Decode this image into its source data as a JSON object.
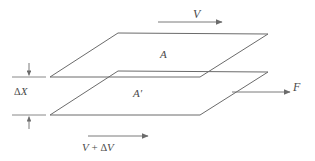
{
  "figure": {
    "canvas": {
      "width": 315,
      "height": 161
    },
    "line_color": "#6b6b6b",
    "text_color": "#4a4a4a",
    "background": "#ffffff"
  },
  "labels": {
    "velocity_top": "V",
    "area_top": "A",
    "area_bottom_base": "A",
    "area_bottom_prime": "′",
    "force": "F",
    "separation_delta": "Δ",
    "separation_var": "X",
    "velocity_bottom_base": "V",
    "velocity_bottom_plus": " + ",
    "velocity_bottom_delta": "Δ",
    "velocity_bottom_var": "V"
  },
  "geometry": {
    "top_plane": {
      "name": "top-plate",
      "points": "118,33 268,34 200,77 50,77"
    },
    "bottom_plane": {
      "name": "bottom-plate",
      "points": "118,71 268,72 200,115 50,115"
    },
    "arrow_top": {
      "x1": 158,
      "y1": 22,
      "x2": 222,
      "y2": 22
    },
    "arrow_force": {
      "x1": 232,
      "y1": 92,
      "x2": 290,
      "y2": 92
    },
    "arrow_bottom": {
      "x1": 88,
      "y1": 136,
      "x2": 148,
      "y2": 136
    },
    "dim_tick_top": {
      "x1": 12,
      "y1": 77,
      "x2": 46,
      "y2": 77
    },
    "dim_tick_bottom": {
      "x1": 12,
      "y1": 115,
      "x2": 46,
      "y2": 115
    },
    "dim_arrow_top": {
      "x": 29,
      "y1": 63,
      "y2": 76
    },
    "dim_arrow_bottom": {
      "x": 29,
      "y1": 129,
      "y2": 116
    }
  }
}
